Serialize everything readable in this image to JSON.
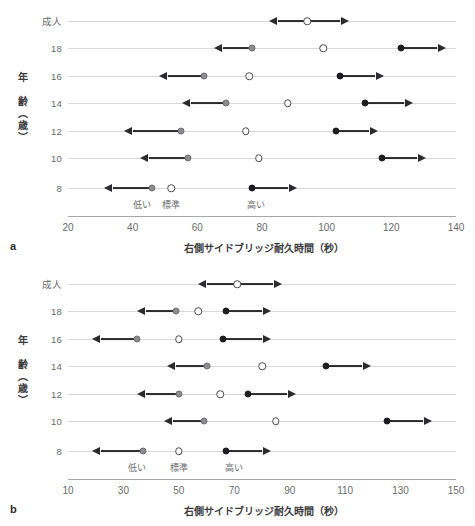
{
  "figure": {
    "panels": [
      {
        "letter": "a",
        "x_title": "右側サイドブリッジ耐久時間（秒）",
        "y_title": "年　齢（歳）",
        "x_ticks": [
          20,
          40,
          60,
          80,
          100,
          120,
          140
        ],
        "xlim": [
          20,
          140
        ],
        "zone_labels": [
          {
            "text": "低い",
            "x": 43
          },
          {
            "text": "標準",
            "x": 52
          },
          {
            "text": "高い",
            "x": 78
          }
        ],
        "categories": [
          "成人",
          "18",
          "16",
          "14",
          "12",
          "10",
          "8"
        ],
        "rows": [
          {
            "category": "成人",
            "low": null,
            "standard": 94,
            "high": null,
            "left_arrow": [
              85,
              94
            ],
            "right_arrow": [
              94,
              104
            ]
          },
          {
            "category": "18",
            "low": 77,
            "standard": 99,
            "high": 123,
            "left_arrow": [
              68,
              77
            ],
            "right_arrow": [
              123,
              134
            ]
          },
          {
            "category": "16",
            "low": 62,
            "standard": 76,
            "high": 104,
            "left_arrow": [
              51,
              62
            ],
            "right_arrow": [
              104,
              115
            ]
          },
          {
            "category": "14",
            "low": 69,
            "standard": 88,
            "high": 112,
            "left_arrow": [
              58,
              69
            ],
            "right_arrow": [
              112,
              124
            ]
          },
          {
            "category": "12",
            "low": 55,
            "standard": 75,
            "high": 103,
            "left_arrow": [
              40,
              55
            ],
            "right_arrow": [
              103,
              113
            ]
          },
          {
            "category": "10",
            "low": 57,
            "standard": 79,
            "high": 117,
            "left_arrow": [
              45,
              57
            ],
            "right_arrow": [
              117,
              128
            ]
          },
          {
            "category": "8",
            "low": 46,
            "standard": 52,
            "high": 77,
            "left_arrow": [
              34,
              46
            ],
            "right_arrow": [
              77,
              88
            ]
          }
        ]
      },
      {
        "letter": "b",
        "x_title": "右側サイドブリッジ耐久時間（秒）",
        "y_title": "年　齢（歳）",
        "x_ticks": [
          10,
          30,
          50,
          70,
          90,
          110,
          130,
          150
        ],
        "xlim": [
          10,
          150
        ],
        "zone_labels": [
          {
            "text": "低い",
            "x": 35
          },
          {
            "text": "標準",
            "x": 50
          },
          {
            "text": "高い",
            "x": 70
          }
        ],
        "categories": [
          "成人",
          "18",
          "16",
          "14",
          "12",
          "10",
          "8"
        ],
        "rows": [
          {
            "category": "成人",
            "low": null,
            "standard": 71,
            "high": null,
            "left_arrow": [
              60,
              71
            ],
            "right_arrow": [
              71,
              84
            ]
          },
          {
            "category": "18",
            "low": 49,
            "standard": 57,
            "high": 67,
            "left_arrow": [
              38,
              49
            ],
            "right_arrow": [
              67,
              80
            ]
          },
          {
            "category": "16",
            "low": 35,
            "standard": 50,
            "high": 66,
            "left_arrow": [
              22,
              35
            ],
            "right_arrow": [
              66,
              80
            ]
          },
          {
            "category": "14",
            "low": 60,
            "standard": 80,
            "high": 103,
            "left_arrow": [
              49,
              60
            ],
            "right_arrow": [
              103,
              116
            ]
          },
          {
            "category": "12",
            "low": 50,
            "standard": 65,
            "high": 75,
            "left_arrow": [
              38,
              50
            ],
            "right_arrow": [
              75,
              89
            ]
          },
          {
            "category": "10",
            "low": 59,
            "standard": 85,
            "high": 125,
            "left_arrow": [
              48,
              59
            ],
            "right_arrow": [
              125,
              138
            ]
          },
          {
            "category": "8",
            "low": 37,
            "standard": 50,
            "high": 67,
            "left_arrow": [
              22,
              37
            ],
            "right_arrow": [
              67,
              80
            ]
          }
        ]
      }
    ]
  },
  "chart_data": {
    "type": "scatter",
    "title": "",
    "xlabel": "右側サイドブリッジ耐久時間（秒）",
    "ylabel": "年　齢（歳）",
    "grid": true,
    "legend": [
      "低い",
      "標準",
      "高い"
    ],
    "legend_position": "in-plot-bottom",
    "panels": [
      {
        "label": "a",
        "xlim": [
          20,
          140
        ],
        "xticks": [
          20,
          40,
          60,
          80,
          100,
          120,
          140
        ],
        "categories": [
          "成人",
          "18",
          "16",
          "14",
          "12",
          "10",
          "8"
        ],
        "series": [
          {
            "name": "低い",
            "marker": "gray-filled-circle",
            "values": [
              null,
              77,
              62,
              69,
              55,
              57,
              46
            ]
          },
          {
            "name": "標準",
            "marker": "open-circle",
            "values": [
              94,
              99,
              76,
              88,
              75,
              79,
              52
            ]
          },
          {
            "name": "高い",
            "marker": "black-filled-circle",
            "values": [
              null,
              123,
              104,
              112,
              103,
              117,
              77
            ]
          }
        ]
      },
      {
        "label": "b",
        "xlim": [
          10,
          150
        ],
        "xticks": [
          10,
          30,
          50,
          70,
          90,
          110,
          130,
          150
        ],
        "categories": [
          "成人",
          "18",
          "16",
          "14",
          "12",
          "10",
          "8"
        ],
        "series": [
          {
            "name": "低い",
            "marker": "gray-filled-circle",
            "values": [
              null,
              49,
              35,
              60,
              50,
              59,
              37
            ]
          },
          {
            "name": "標準",
            "marker": "open-circle",
            "values": [
              71,
              57,
              50,
              80,
              65,
              85,
              50
            ]
          },
          {
            "name": "高い",
            "marker": "black-filled-circle",
            "values": [
              null,
              67,
              66,
              103,
              75,
              125,
              67
            ]
          }
        ]
      }
    ]
  }
}
